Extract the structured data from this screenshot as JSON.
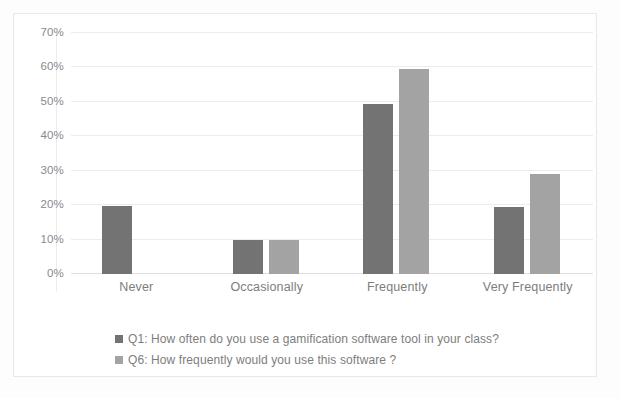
{
  "chart_data": {
    "type": "bar",
    "title": "",
    "subtitle": "",
    "xlabel": "",
    "ylabel": "",
    "categories": [
      "Never",
      "Occasionally",
      "Frequently",
      "Very Frequently"
    ],
    "series": [
      {
        "name": "Q1: How often do you use a gamification software tool in your class?",
        "short_name": "Q1",
        "color": "#737373",
        "values": [
          19.8,
          9.9,
          49.5,
          19.5
        ]
      },
      {
        "name": "Q6: How frequently would you use this software?",
        "short_name": "Q6",
        "color": "#a3a3a3",
        "values": [
          0,
          9.9,
          59.5,
          29.0
        ]
      }
    ],
    "ylim": [
      0,
      70
    ],
    "ytick_values": [
      0,
      10,
      20,
      30,
      40,
      50,
      60,
      70
    ],
    "ytick_labels": [
      "0%",
      "10%",
      "20%",
      "30%",
      "40%",
      "50%",
      "60%",
      "70%"
    ],
    "grid": true,
    "legend_position": "bottom-left",
    "value_suffix": "%",
    "plot_background": "#ffffff",
    "grid_color": "#ececec",
    "text_color": "#7d7d7d",
    "frame_color": "#e8e8e8"
  },
  "legend": {
    "entries": [
      {
        "label": "Q1: How often do you use a gamification software tool in your class?",
        "color": "#737373"
      },
      {
        "label": "Q6: How frequently would you use this software ?",
        "color": "#a3a3a3"
      }
    ]
  }
}
